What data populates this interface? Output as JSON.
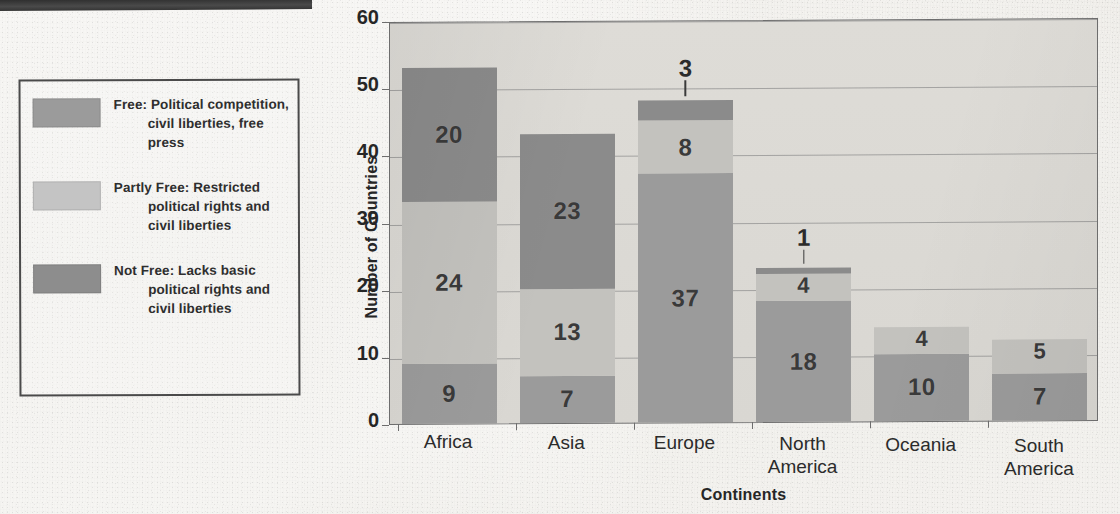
{
  "chart_data": {
    "type": "bar",
    "subtype": "stacked-bar",
    "title": "",
    "xlabel": "Continents",
    "ylabel": "Number of Countries",
    "ylim": [
      0,
      60
    ],
    "yticks": [
      0,
      10,
      20,
      30,
      40,
      50,
      60
    ],
    "grid": true,
    "legend_position": "left-outside",
    "categories": [
      "Africa",
      "Asia",
      "Europe",
      "North America",
      "Oceania",
      "South America"
    ],
    "series": [
      {
        "name": "Free",
        "color": "#9b9b9b",
        "values": [
          9,
          7,
          37,
          18,
          10,
          7
        ]
      },
      {
        "name": "Partly Free",
        "color": "#c3c2be",
        "values": [
          24,
          13,
          8,
          4,
          4,
          5
        ]
      },
      {
        "name": "Not Free",
        "color": "#8b8b8b",
        "values": [
          20,
          23,
          3,
          1,
          0,
          0
        ]
      }
    ],
    "totals": [
      53,
      43,
      48,
      23,
      14,
      12
    ],
    "callout_labels": [
      {
        "category": "Europe",
        "series": "Not Free",
        "value": "3"
      },
      {
        "category": "North America",
        "series": "Not Free",
        "value": "1"
      }
    ]
  },
  "legend": {
    "items": [
      {
        "swatch": "free-swatch",
        "label": "Free: Political competition, civil liberties, free press"
      },
      {
        "swatch": "partly-free-swatch",
        "label": "Partly Free: Restricted political rights and civil liberties"
      },
      {
        "swatch": "not-free-swatch",
        "label": "Not Free: Lacks basic political rights and civil liberties"
      }
    ]
  },
  "axes": {
    "y_title": "Number of Countries",
    "x_title": "Continents",
    "y_tick_labels": [
      "60",
      "50",
      "40",
      "30",
      "20",
      "10",
      "0"
    ],
    "x_tick_labels": [
      [
        "Africa"
      ],
      [
        "Asia"
      ],
      [
        "Europe"
      ],
      [
        "North",
        "America"
      ],
      [
        "Oceania"
      ],
      [
        "South",
        "America"
      ]
    ]
  },
  "bar_value_labels": {
    "africa": {
      "free": "9",
      "partly": "24",
      "not_free": "20"
    },
    "asia": {
      "free": "7",
      "partly": "13",
      "not_free": "23"
    },
    "europe": {
      "free": "37",
      "partly": "8",
      "not_free": "3"
    },
    "north_america": {
      "free": "18",
      "partly": "4",
      "not_free": "1"
    },
    "oceania": {
      "free": "10",
      "partly": "4",
      "not_free": ""
    },
    "south_america": {
      "free": "7",
      "partly": "5",
      "not_free": ""
    }
  },
  "colors": {
    "free": "#9b9b9b",
    "partly_free": "#c3c2be",
    "not_free": "#8b8b8b",
    "plot_background": "#dedcd7",
    "page_background": "#e9e7e2",
    "gridline": "#8e8e8e",
    "text": "#2b2b2b"
  }
}
